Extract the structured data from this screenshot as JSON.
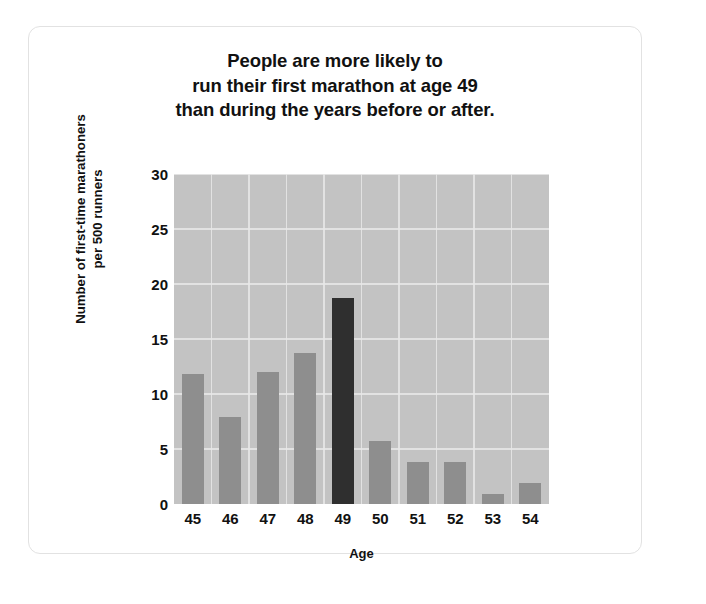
{
  "card": {
    "accent_bar_color": "#2f2f2f",
    "bar_color": "#8e8e8e",
    "plot_background": "#c3c3c3",
    "gridline_color": "#e8e8e8",
    "border_color": "#e2e2e2"
  },
  "chart_data": {
    "type": "bar",
    "title": "People are more likely to run their first marathon at age 49 than during the years before or after.",
    "title_lines": [
      "People are more likely to",
      "run their first marathon at age 49",
      "than during the years before or after."
    ],
    "xlabel": "Age",
    "ylabel": "Number of first-time marathoners per 500 runners",
    "ylabel_lines": [
      "Number of first-time marathoners",
      "per 500 runners"
    ],
    "categories": [
      "45",
      "46",
      "47",
      "48",
      "49",
      "50",
      "51",
      "52",
      "53",
      "54"
    ],
    "values": [
      11.8,
      7.9,
      12.0,
      13.7,
      18.7,
      5.7,
      3.8,
      3.8,
      0.9,
      1.9
    ],
    "highlight_category": "49",
    "ylim": [
      0,
      30
    ],
    "ytick_labels": [
      "0",
      "5",
      "10",
      "15",
      "20",
      "25",
      "30"
    ],
    "ytick_values": [
      0,
      5,
      10,
      15,
      20,
      25,
      30
    ],
    "grid": "horizontal-and-vertical",
    "legend": "none"
  }
}
